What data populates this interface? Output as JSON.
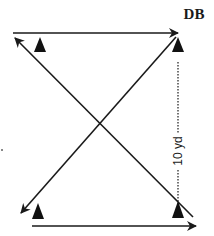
{
  "diagram": {
    "type": "football drill diagram",
    "labels": {
      "defender": "DB",
      "distance": "10 yd"
    },
    "colors": {
      "line": "#1a1a1a",
      "background": "#ffffff"
    },
    "cones": [
      {
        "name": "cone-top-left",
        "x": 40,
        "y": 47
      },
      {
        "name": "cone-top-right",
        "x": 178,
        "y": 47
      },
      {
        "name": "cone-bottom-left",
        "x": 38,
        "y": 214
      },
      {
        "name": "cone-bottom-right",
        "x": 178,
        "y": 212
      }
    ],
    "paths": [
      {
        "name": "top-horizontal-run",
        "from": [
          13,
          33
        ],
        "to": [
          178,
          33
        ],
        "direction": "right"
      },
      {
        "name": "diagonal-backpedal-to-top-left",
        "from": [
          193,
          217
        ],
        "to": [
          15,
          38
        ],
        "direction": "up-left"
      },
      {
        "name": "diagonal-from-top-right-to-bottom-left",
        "from": [
          176,
          37
        ],
        "to": [
          21,
          213
        ],
        "direction": "down-left"
      },
      {
        "name": "bottom-horizontal-run",
        "from": [
          32,
          226
        ],
        "to": [
          196,
          226
        ],
        "direction": "right"
      }
    ],
    "measure_line": {
      "x": 178,
      "y_start": 62,
      "y_end": 208,
      "style": "dotted"
    }
  }
}
